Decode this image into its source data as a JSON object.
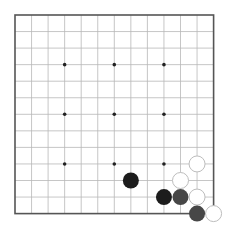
{
  "board": {
    "size": 13,
    "origin": {
      "x": 15,
      "y": 15
    },
    "spacing": 16.55,
    "line_color": "#b8b8b8",
    "border_color": "#555555",
    "star_points": [
      [
        3,
        3
      ],
      [
        6,
        3
      ],
      [
        9,
        3
      ],
      [
        3,
        6
      ],
      [
        6,
        6
      ],
      [
        9,
        6
      ],
      [
        3,
        9
      ],
      [
        6,
        9
      ],
      [
        9,
        9
      ]
    ],
    "stone_radius": 8,
    "colors": {
      "black": "#1c1c1c",
      "gray": "#474747",
      "white_fill": "#ffffff",
      "white_stroke": "#bdbdbd"
    },
    "stones": [
      {
        "col": 7,
        "row": 10,
        "color": "black"
      },
      {
        "col": 11,
        "row": 9,
        "color": "white"
      },
      {
        "col": 10,
        "row": 10,
        "color": "white"
      },
      {
        "col": 9,
        "row": 11,
        "color": "black"
      },
      {
        "col": 10,
        "row": 11,
        "color": "gray"
      },
      {
        "col": 11,
        "row": 11,
        "color": "white"
      },
      {
        "col": 11,
        "row": 12,
        "color": "gray"
      },
      {
        "col": 12,
        "row": 12,
        "color": "white"
      }
    ]
  }
}
